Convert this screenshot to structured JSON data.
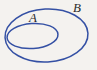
{
  "figure": {
    "name": "venn-subset-diagram",
    "background_color": "#f4f2ef",
    "stroke_color": "#3450a4",
    "label_color": "#2b2b2b",
    "stroke_width": 1.5
  },
  "sets": {
    "inner": {
      "label": "A",
      "cx": 32.5,
      "cy": 36,
      "rx": 25.5,
      "ry": 12.5,
      "rotation": -4
    },
    "outer": {
      "label": "B",
      "cx": 46.5,
      "cy": 35.5,
      "rx": 41.5,
      "ry": 26.5,
      "rotation": -3
    }
  },
  "labels": {
    "a": "A",
    "b": "B"
  }
}
